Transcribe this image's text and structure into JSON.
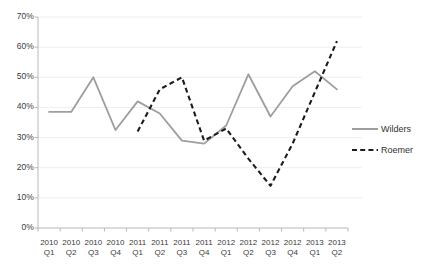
{
  "chart_data": {
    "type": "line",
    "title": "",
    "subtitle": "",
    "xlabel": "",
    "ylabel": "",
    "ylim": [
      0,
      70
    ],
    "ytick_labels": [
      "0%",
      "10%",
      "20%",
      "30%",
      "40%",
      "50%",
      "60%",
      "70%"
    ],
    "ytick_values": [
      0,
      10,
      20,
      30,
      40,
      50,
      60,
      70
    ],
    "grid": true,
    "legend_position": "right",
    "categories": [
      "2010 Q1",
      "2010 Q2",
      "2010 Q3",
      "2010 Q4",
      "2011 Q1",
      "2011 Q2",
      "2011 Q3",
      "2011 Q4",
      "2012 Q1",
      "2012 Q2",
      "2012 Q3",
      "2012 Q4",
      "2013 Q1",
      "2013 Q2"
    ],
    "category_years": [
      "2010",
      "2010",
      "2010",
      "2010",
      "2011",
      "2011",
      "2011",
      "2011",
      "2012",
      "2012",
      "2012",
      "2012",
      "2013",
      "2013"
    ],
    "category_quarters": [
      "Q1",
      "Q2",
      "Q3",
      "Q4",
      "Q1",
      "Q2",
      "Q3",
      "Q4",
      "Q1",
      "Q2",
      "Q3",
      "Q4",
      "Q1",
      "Q2"
    ],
    "series": [
      {
        "name": "Wilders",
        "style": "solid",
        "color": "#9e9e9e",
        "values": [
          38.5,
          38.5,
          50.0,
          32.5,
          42.0,
          38.0,
          29.0,
          28.0,
          34.0,
          51.0,
          37.0,
          47.0,
          52.0,
          46.0
        ]
      },
      {
        "name": "Roemer",
        "style": "dashed",
        "color": "#1c1c1c",
        "values": [
          null,
          null,
          null,
          null,
          32.0,
          46.0,
          50.0,
          29.0,
          33.0,
          23.0,
          14.0,
          28.0,
          45.0,
          62.0
        ]
      }
    ]
  },
  "legend": {
    "items": [
      {
        "label": "Wilders",
        "style": "solid",
        "color": "#9e9e9e"
      },
      {
        "label": "Roemer",
        "style": "dashed",
        "color": "#1c1c1c"
      }
    ]
  },
  "axis": {
    "y_axis_color": "#b8b8b8",
    "x_axis_color": "#b8b8b8",
    "grid_color": "#eeeeee"
  }
}
